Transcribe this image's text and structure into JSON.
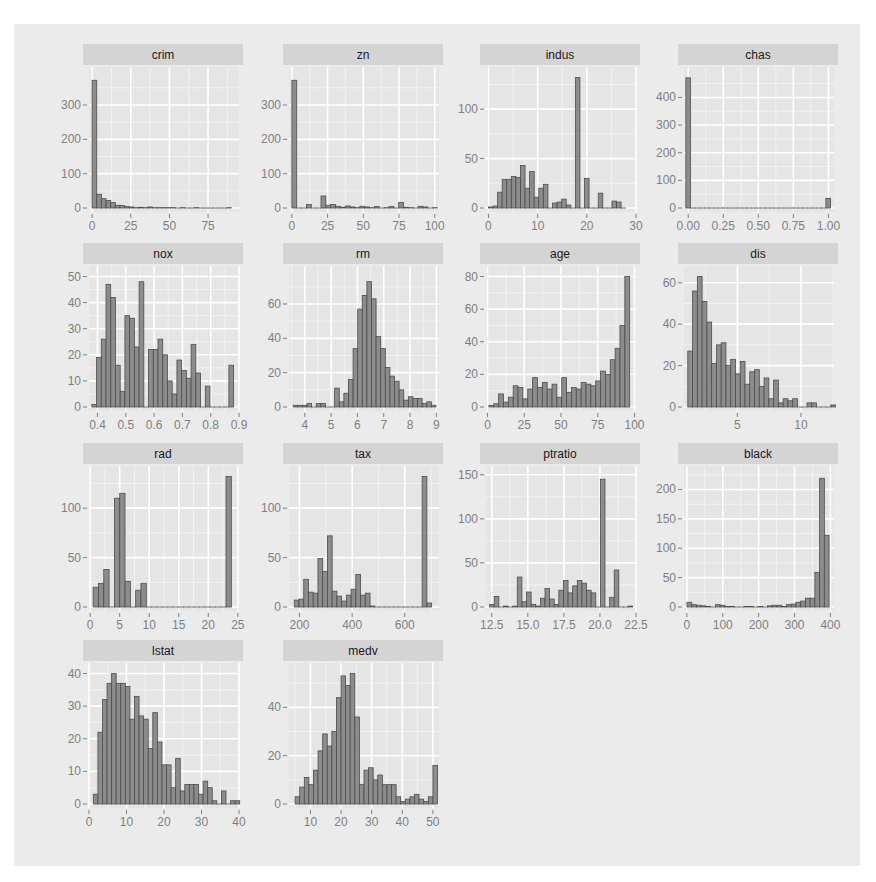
{
  "figure": {
    "background": "#ebebeb",
    "panel_background": "#e5e5e5",
    "strip_background": "#d4d4d4",
    "grid_major": "#ffffff",
    "grid_minor": "#f2f2f2",
    "bar_fill": "#8c8c8c",
    "bar_stroke": "#4d4d4d",
    "tick_text_color": "#7f7f7f",
    "strip_text_color": "#1a1a1a"
  },
  "chart_data": [
    {
      "type": "bar",
      "title": "crim",
      "xlim": [
        -2,
        95
      ],
      "ylim": [
        0,
        380
      ],
      "xticks": [
        0,
        25,
        50,
        75
      ],
      "xtick_labels": [
        "0",
        "25",
        "50",
        "75"
      ],
      "yticks": [
        0,
        100,
        200,
        300
      ],
      "ytick_labels": [
        "0",
        "100",
        "200",
        "300"
      ],
      "bin_start": 0,
      "bin_width": 3.0,
      "values": [
        372,
        40,
        27,
        22,
        16,
        8,
        7,
        4,
        3,
        1,
        2,
        1,
        3,
        1,
        1,
        1,
        1,
        1,
        0,
        1,
        0,
        0,
        1,
        0,
        0,
        0,
        0,
        0,
        0,
        1
      ]
    },
    {
      "type": "bar",
      "title": "zn",
      "xlim": [
        -2,
        103
      ],
      "ylim": [
        0,
        380
      ],
      "xticks": [
        0,
        25,
        50,
        75,
        100
      ],
      "xtick_labels": [
        "0",
        "25",
        "50",
        "75",
        "100"
      ],
      "yticks": [
        0,
        100,
        200,
        300
      ],
      "ytick_labels": [
        "0",
        "100",
        "200",
        "300"
      ],
      "bin_start": 0,
      "bin_width": 3.4,
      "values": [
        372,
        0,
        0,
        10,
        0,
        0,
        35,
        8,
        10,
        5,
        2,
        6,
        3,
        1,
        5,
        3,
        1,
        4,
        0,
        1,
        4,
        0,
        16,
        2,
        1,
        0,
        5,
        3,
        0,
        1
      ]
    },
    {
      "type": "bar",
      "title": "indus",
      "xlim": [
        -0.5,
        30
      ],
      "ylim": [
        0,
        132
      ],
      "xticks": [
        0,
        10,
        20,
        30
      ],
      "xtick_labels": [
        "0",
        "10",
        "20",
        "30"
      ],
      "yticks": [
        0,
        50,
        100
      ],
      "ytick_labels": [
        "0",
        "50",
        "100"
      ],
      "bin_start": 0.0,
      "bin_width": 0.93,
      "values": [
        1,
        2,
        16,
        29,
        29,
        32,
        31,
        43,
        20,
        37,
        11,
        20,
        24,
        0,
        5,
        6,
        9,
        3,
        0,
        132,
        0,
        30,
        0,
        0,
        15,
        0,
        0,
        7,
        6,
        0
      ]
    },
    {
      "type": "bar",
      "title": "chas",
      "xlim": [
        -0.03,
        1.04
      ],
      "ylim": [
        0,
        472
      ],
      "xticks": [
        0,
        0.25,
        0.5,
        0.75,
        1.0
      ],
      "xtick_labels": [
        "0.00",
        "0.25",
        "0.50",
        "0.75",
        "1.00"
      ],
      "yticks": [
        0,
        100,
        200,
        300,
        400
      ],
      "ytick_labels": [
        "0",
        "100",
        "200",
        "300",
        "400"
      ],
      "bin_start": -0.0167,
      "bin_width": 0.0333,
      "values": [
        471,
        0,
        0,
        0,
        0,
        0,
        0,
        0,
        0,
        0,
        0,
        0,
        0,
        0,
        0,
        0,
        0,
        0,
        0,
        0,
        0,
        0,
        0,
        0,
        0,
        0,
        0,
        0,
        0,
        0,
        35
      ]
    },
    {
      "type": "bar",
      "title": "nox",
      "xlim": [
        0.37,
        0.9
      ],
      "ylim": [
        0,
        50
      ],
      "xticks": [
        0.4,
        0.5,
        0.6,
        0.7,
        0.8,
        0.9
      ],
      "xtick_labels": [
        "0.4",
        "0.5",
        "0.6",
        "0.7",
        "0.8",
        "0.9"
      ],
      "yticks": [
        0,
        10,
        20,
        30,
        40,
        50
      ],
      "ytick_labels": [
        "0",
        "10",
        "20",
        "30",
        "40",
        "50"
      ],
      "bin_start": 0.38,
      "bin_width": 0.0167,
      "values": [
        1,
        19,
        26,
        47,
        42,
        16,
        6,
        35,
        34,
        23,
        48,
        0,
        22,
        22,
        26,
        20,
        10,
        5,
        18,
        14,
        11,
        24,
        13,
        0,
        8,
        0,
        0,
        0,
        0,
        16
      ]
    },
    {
      "type": "bar",
      "title": "rm",
      "xlim": [
        3.4,
        9.1
      ],
      "ylim": [
        0,
        76
      ],
      "xticks": [
        4,
        5,
        6,
        7,
        8,
        9
      ],
      "xtick_labels": [
        "4",
        "5",
        "6",
        "7",
        "8",
        "9"
      ],
      "yticks": [
        0,
        20,
        40,
        60
      ],
      "ytick_labels": [
        "0",
        "20",
        "40",
        "60"
      ],
      "bin_start": 3.56,
      "bin_width": 0.175,
      "values": [
        1,
        1,
        1,
        2,
        0,
        2,
        2,
        0,
        0,
        11,
        3,
        8,
        16,
        34,
        57,
        65,
        73,
        63,
        41,
        34,
        23,
        18,
        15,
        10,
        4,
        6,
        5,
        5,
        2,
        3,
        1
      ]
    },
    {
      "type": "bar",
      "title": "age",
      "xlim": [
        -1,
        101
      ],
      "ylim": [
        0,
        80
      ],
      "xticks": [
        0,
        25,
        50,
        75,
        100
      ],
      "xtick_labels": [
        "0",
        "25",
        "50",
        "75",
        "100"
      ],
      "yticks": [
        0,
        20,
        40,
        60,
        80
      ],
      "ytick_labels": [
        "0",
        "20",
        "40",
        "60",
        "80"
      ],
      "bin_start": 1.0,
      "bin_width": 3.3,
      "values": [
        1,
        2,
        8,
        3,
        6,
        13,
        12,
        5,
        11,
        18,
        12,
        15,
        11,
        14,
        6,
        18,
        9,
        12,
        11,
        15,
        14,
        13,
        16,
        22,
        20,
        29,
        36,
        50,
        80
      ]
    },
    {
      "type": "bar",
      "title": "dis",
      "xlim": [
        0.8,
        12.6
      ],
      "ylim": [
        0,
        63
      ],
      "xticks": [
        5,
        10
      ],
      "xtick_labels": [
        "5",
        "10"
      ],
      "yticks": [
        0,
        20,
        40,
        60
      ],
      "ytick_labels": [
        "0",
        "20",
        "40",
        "60"
      ],
      "bin_start": 1.1,
      "bin_width": 0.375,
      "values": [
        27,
        56,
        63,
        51,
        41,
        21,
        30,
        31,
        20,
        23,
        16,
        22,
        11,
        17,
        18,
        10,
        14,
        4,
        13,
        2,
        4,
        3,
        4,
        0,
        0,
        2,
        2,
        0,
        0,
        0,
        1
      ]
    },
    {
      "type": "bar",
      "title": "rad",
      "xlim": [
        -0.2,
        25.2
      ],
      "ylim": [
        0,
        132
      ],
      "xticks": [
        0,
        5,
        10,
        15,
        20,
        25
      ],
      "xtick_labels": [
        "0",
        "5",
        "10",
        "15",
        "20",
        "25"
      ],
      "yticks": [
        0,
        50,
        100
      ],
      "ytick_labels": [
        "0",
        "50",
        "100"
      ],
      "bin_start": 0.5,
      "bin_width": 0.9,
      "values": [
        20,
        24,
        38,
        0,
        110,
        115,
        26,
        0,
        17,
        24,
        0,
        0,
        0,
        0,
        0,
        0,
        0,
        0,
        0,
        0,
        0,
        0,
        0,
        0,
        0,
        132
      ]
    },
    {
      "type": "bar",
      "title": "tax",
      "xlim": [
        160,
        730
      ],
      "ylim": [
        0,
        132
      ],
      "xticks": [
        200,
        400,
        600
      ],
      "xtick_labels": [
        "200",
        "400",
        "600"
      ],
      "yticks": [
        0,
        50,
        100
      ],
      "ytick_labels": [
        "0",
        "50",
        "100"
      ],
      "bin_start": 180,
      "bin_width": 18.0,
      "values": [
        7,
        8,
        28,
        15,
        14,
        49,
        36,
        72,
        16,
        11,
        6,
        12,
        18,
        33,
        12,
        14,
        1,
        0,
        0,
        0,
        0,
        0,
        0,
        0,
        0,
        0,
        0,
        132,
        4
      ]
    },
    {
      "type": "bar",
      "title": "ptratio",
      "xlim": [
        12.1,
        22.5
      ],
      "ylim": [
        0,
        148
      ],
      "xticks": [
        12.5,
        15.0,
        17.5,
        20.0,
        22.5
      ],
      "xtick_labels": [
        "12.5",
        "15.0",
        "17.5",
        "20.0",
        "22.5"
      ],
      "yticks": [
        0,
        50,
        100,
        150
      ],
      "ytick_labels": [
        "0",
        "50",
        "100",
        "150"
      ],
      "bin_start": 12.35,
      "bin_width": 0.32,
      "values": [
        3,
        12,
        0,
        1,
        0,
        1,
        34,
        6,
        17,
        3,
        1,
        10,
        21,
        9,
        3,
        19,
        30,
        16,
        24,
        30,
        27,
        19,
        16,
        0,
        145,
        0,
        11,
        42,
        0,
        0,
        1
      ]
    },
    {
      "type": "bar",
      "title": "black",
      "xlim": [
        -8,
        410
      ],
      "ylim": [
        0,
        222
      ],
      "xticks": [
        0,
        100,
        200,
        300,
        400
      ],
      "xtick_labels": [
        "0",
        "100",
        "200",
        "300",
        "400"
      ],
      "yticks": [
        0,
        50,
        100,
        150,
        200
      ],
      "ytick_labels": [
        "0",
        "50",
        "100",
        "150",
        "200"
      ],
      "bin_start": 0.3,
      "bin_width": 13.2,
      "values": [
        8,
        4,
        3,
        2,
        1,
        0,
        4,
        3,
        1,
        1,
        0,
        0,
        1,
        1,
        0,
        1,
        0,
        2,
        3,
        3,
        1,
        4,
        5,
        8,
        10,
        15,
        15,
        59,
        219,
        122
      ]
    },
    {
      "type": "bar",
      "title": "lstat",
      "xlim": [
        0,
        40
      ],
      "ylim": [
        0,
        40
      ],
      "xticks": [
        0,
        10,
        20,
        30,
        40
      ],
      "xtick_labels": [
        "0",
        "10",
        "20",
        "30",
        "40"
      ],
      "yticks": [
        0,
        10,
        20,
        30,
        40
      ],
      "ytick_labels": [
        "0",
        "10",
        "20",
        "30",
        "40"
      ],
      "bin_start": 1.15,
      "bin_width": 1.22,
      "values": [
        3,
        22,
        32,
        37,
        40,
        37,
        37,
        36,
        26,
        33,
        27,
        26,
        17,
        28,
        19,
        12,
        12,
        5,
        14,
        4,
        6,
        6,
        6,
        3,
        7,
        5,
        1,
        0,
        4,
        0,
        1,
        1
      ]
    },
    {
      "type": "bar",
      "title": "medv",
      "xlim": [
        3,
        52
      ],
      "ylim": [
        0,
        54
      ],
      "xticks": [
        10,
        20,
        30,
        40,
        50
      ],
      "xtick_labels": [
        "10",
        "20",
        "30",
        "40",
        "50"
      ],
      "yticks": [
        0,
        20,
        40
      ],
      "ytick_labels": [
        "0",
        "20",
        "40"
      ],
      "bin_start": 5.0,
      "bin_width": 1.5,
      "values": [
        3,
        7,
        11,
        8,
        14,
        22,
        29,
        24,
        30,
        44,
        53,
        49,
        54,
        36,
        8,
        14,
        15,
        10,
        12,
        8,
        8,
        8,
        3,
        1,
        2,
        3,
        4,
        2,
        1,
        3,
        16
      ]
    }
  ]
}
